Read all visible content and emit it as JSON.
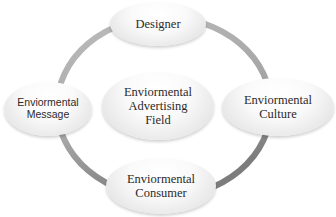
{
  "diagram": {
    "type": "cycle",
    "ring_color_top": "#b0b0b0",
    "ring_color_bottom": "#7a7a7a",
    "center": {
      "lines": [
        "Enviormental",
        "Advertising",
        "Field"
      ]
    },
    "nodes": [
      {
        "id": "designer",
        "lines": [
          "Designer"
        ]
      },
      {
        "id": "culture",
        "lines": [
          "Enviormental",
          "Culture"
        ]
      },
      {
        "id": "consumer",
        "lines": [
          "Enviormental",
          "Consumer"
        ]
      },
      {
        "id": "message",
        "lines": [
          "Enviormental",
          "Message"
        ]
      }
    ]
  }
}
